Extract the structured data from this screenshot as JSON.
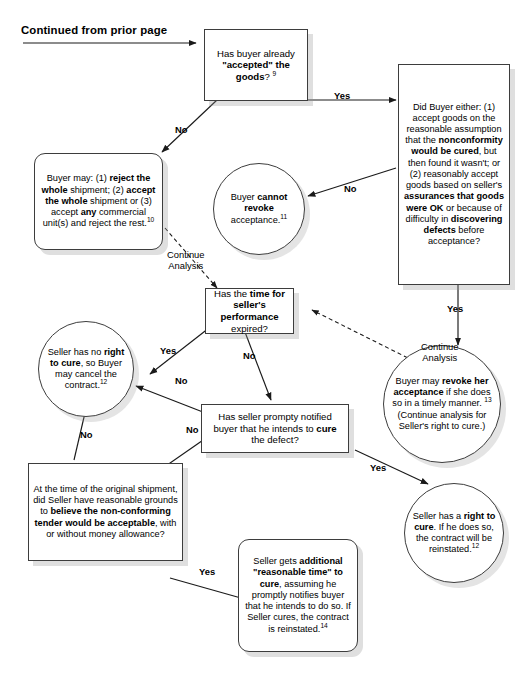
{
  "header": {
    "continued_label": "Continued from prior page"
  },
  "edge_labels": {
    "yes": "Yes",
    "no": "No",
    "continue_analysis": "Continue\nAnalysis"
  },
  "nodes": {
    "has_buyer_accepted": {
      "name": "has-buyer-accepted-goods",
      "shape": "rect",
      "text_html": "Has buyer already <b>\"accepted\" the goods</b>? <sup>9</sup>",
      "plain": "Has buyer already \"accepted\" the goods? 9"
    },
    "did_buyer_either": {
      "name": "did-buyer-either",
      "shape": "rect",
      "text_html": "Did Buyer either: (1) accept goods on the reasonable assumption that the <b>nonconformity would be cured</b>, but then found it wasn't; or (2) reasonably accept goods based on seller's <b>assurances that goods were OK</b> or because of difficulty in <b>discovering defects</b> before acceptance?",
      "plain": "Did Buyer either: (1) accept goods on the reasonable assumption that the nonconformity would be cured, but then found it wasn't; or (2) reasonably accept goods based on seller's assurances that goods were OK or because of difficulty in discovering defects before acceptance?"
    },
    "buyer_may_reject": {
      "name": "buyer-may-reject-accept",
      "shape": "round",
      "text_html": "Buyer may: (1) <b>reject the whole</b> shipment; (2) <b>accept the whole</b> shipment or (3) accept <b>any</b> commercial unit(s) and reject the rest.<sup>10</sup>",
      "plain": "Buyer may: (1) reject the whole shipment; (2) accept the whole shipment or (3) accept any commercial unit(s) and reject the rest.10"
    },
    "buyer_cannot_revoke": {
      "name": "buyer-cannot-revoke-acceptance",
      "shape": "oval",
      "text_html": "Buyer <b>cannot revoke</b> acceptance.<sup>11</sup>",
      "plain": "Buyer cannot revoke acceptance.11"
    },
    "time_for_performance": {
      "name": "has-time-for-sellers-performance-expired",
      "shape": "rect",
      "text_html": "Has the <b>time for seller's performance</b> expired?",
      "plain": "Has the time for seller's performance expired?"
    },
    "seller_no_right_to_cure": {
      "name": "seller-has-no-right-to-cure",
      "shape": "oval",
      "text_html": "Seller has no <b>right to cure</b>, so Buyer may cancel the contract.<sup>12</sup>",
      "plain": "Seller has no right to cure, so Buyer may cancel the contract.12"
    },
    "buyer_may_revoke": {
      "name": "buyer-may-revoke-acceptance",
      "shape": "oval",
      "text_html": "Buyer may <b>revoke her acceptance</b> if she does so in a timely manner. <sup>13</sup> (Continue analysis for Seller's right to cure.)",
      "plain": "Buyer may revoke her acceptance if she does so in a timely manner. 13 (Continue analysis for Seller's right to cure.)"
    },
    "seller_notified_cure": {
      "name": "has-seller-promptly-notified-buyer",
      "shape": "rect",
      "text_html": "Has seller prompty notified buyer that he intends to <b>cure</b> the defect?",
      "plain": "Has seller prompty notified buyer that he intends to cure the defect?"
    },
    "reasonable_grounds": {
      "name": "seller-reasonable-grounds-nonconforming-tender",
      "shape": "rect",
      "text_html": "At the time of the original shipment, did Seller have reasonable grounds to <b>believe the non-conforming tender would be acceptable</b>, with or without money allowance?",
      "plain": "At the time of the original shipment, did Seller have reasonable grounds to believe the non-conforming tender would be acceptable, with or without money allowance?"
    },
    "seller_has_right_to_cure": {
      "name": "seller-has-right-to-cure",
      "shape": "oval",
      "text_html": "Seller has a <b>right to cure</b>. If he does so, the contract will be reinstated.<sup>12</sup>",
      "plain": "Seller has a right to cure. If he does so, the contract will be reinstated.12"
    },
    "additional_reasonable_time": {
      "name": "seller-gets-additional-reasonable-time",
      "shape": "round",
      "text_html": "Seller gets <b>additional \"reasonable time\" to cure</b>, assuming he promptly notifies buyer that he intends to do so. If Seller cures, the contract is reinstated.<sup>14</sup>",
      "plain": "Seller gets additional \"reasonable time\" to cure, assuming he promptly notifies buyer that he intends to do so. If Seller cures, the contract is reinstated.14"
    }
  }
}
